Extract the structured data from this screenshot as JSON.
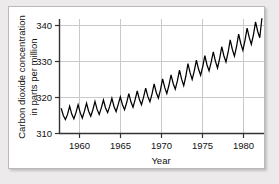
{
  "chart_data": {
    "type": "line",
    "title": "",
    "subtitle": "",
    "xlabel": "Year",
    "ylabel": "Carbon dioxide concentration in parts per million",
    "ylabel_line1": "Carbon dioxide concentration",
    "ylabel_line2": "in parts per million",
    "xlim": [
      1958.0,
      1982.2
    ],
    "ylim": [
      310,
      343
    ],
    "xticks": [
      1960,
      1965,
      1970,
      1975,
      1980
    ],
    "xtick_labels": [
      "1960",
      "1965",
      "1970",
      "1975",
      "1980"
    ],
    "yticks": [
      310,
      320,
      330,
      340
    ],
    "ytick_labels": [
      "310",
      "320",
      "330",
      "340"
    ],
    "grid": "both",
    "legend": "none",
    "line_color": "#000000",
    "grid_color": "#c9c9c9",
    "axis_color": "#333333",
    "series": [
      {
        "name": "Atmospheric CO2 (Mauna Loa)",
        "description": "Monthly mean CO2 concentration showing a rising trend with an annual sawtooth seasonal cycle",
        "x": [
          1958.2,
          1958.45,
          1958.7,
          1958.95,
          1959.2,
          1959.45,
          1959.7,
          1959.95,
          1960.2,
          1960.45,
          1960.7,
          1960.95,
          1961.2,
          1961.45,
          1961.7,
          1961.95,
          1962.2,
          1962.45,
          1962.7,
          1962.95,
          1963.2,
          1963.45,
          1963.7,
          1963.95,
          1964.2,
          1964.45,
          1964.7,
          1964.95,
          1965.2,
          1965.45,
          1965.7,
          1965.95,
          1966.2,
          1966.45,
          1966.7,
          1966.95,
          1967.2,
          1967.45,
          1967.7,
          1967.95,
          1968.2,
          1968.45,
          1968.7,
          1968.95,
          1969.2,
          1969.45,
          1969.7,
          1969.95,
          1970.2,
          1970.45,
          1970.7,
          1970.95,
          1971.2,
          1971.45,
          1971.7,
          1971.95,
          1972.2,
          1972.45,
          1972.7,
          1972.95,
          1973.2,
          1973.45,
          1973.7,
          1973.95,
          1974.2,
          1974.45,
          1974.7,
          1974.95,
          1975.2,
          1975.45,
          1975.7,
          1975.95,
          1976.2,
          1976.45,
          1976.7,
          1976.95,
          1977.2,
          1977.45,
          1977.7,
          1977.95,
          1978.2,
          1978.45,
          1978.7,
          1978.95,
          1979.2,
          1979.45,
          1979.7,
          1979.95,
          1980.2,
          1980.45,
          1980.7,
          1980.95,
          1981.2,
          1981.45,
          1981.7,
          1981.95
        ],
        "y": [
          317.0,
          315.0,
          313.9,
          315.3,
          317.6,
          315.4,
          314.1,
          315.8,
          318.0,
          315.8,
          314.3,
          316.2,
          318.4,
          316.2,
          314.8,
          316.6,
          318.9,
          316.7,
          315.3,
          317.1,
          319.3,
          317.1,
          315.8,
          317.6,
          319.8,
          317.5,
          316.1,
          318.1,
          320.2,
          318.0,
          316.6,
          318.6,
          321.1,
          318.8,
          317.3,
          319.4,
          321.8,
          319.5,
          318.0,
          320.1,
          322.6,
          320.3,
          318.8,
          321.0,
          323.8,
          321.4,
          319.8,
          322.1,
          325.2,
          322.8,
          321.1,
          323.4,
          326.3,
          323.9,
          322.3,
          324.6,
          327.6,
          325.1,
          323.3,
          325.9,
          329.4,
          326.9,
          325.0,
          327.4,
          330.4,
          327.9,
          326.2,
          328.6,
          331.6,
          329.1,
          327.4,
          329.8,
          332.7,
          330.1,
          328.2,
          330.8,
          334.1,
          331.6,
          329.9,
          332.5,
          336.0,
          333.4,
          331.5,
          334.1,
          337.6,
          335.0,
          333.1,
          335.9,
          339.3,
          336.7,
          334.8,
          337.4,
          341.0,
          338.4,
          336.6,
          342.0
        ],
        "y_min": 313.9,
        "y_max": 342.0,
        "start_year": 1958,
        "end_year": 1982
      }
    ]
  }
}
